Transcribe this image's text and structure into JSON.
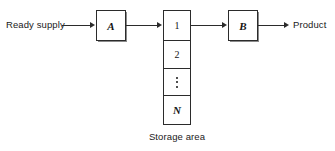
{
  "diagram": {
    "background_color": "#ffffff",
    "stroke_color": "#2b2b2b",
    "text_color": "#1a1a1a",
    "inputs": {
      "ready_supply_label": "Ready supply"
    },
    "outputs": {
      "product_label": "Product"
    },
    "process_boxes": [
      {
        "id": "A",
        "label": "A"
      },
      {
        "id": "B",
        "label": "B"
      }
    ],
    "storage": {
      "caption": "Storage area",
      "cells": [
        {
          "label": "1",
          "kind": "number"
        },
        {
          "label": "2",
          "kind": "number"
        },
        {
          "label": "⋮",
          "kind": "ellipsis"
        },
        {
          "label": "N",
          "kind": "variable"
        }
      ]
    },
    "connectors": [
      {
        "from": "ready-supply",
        "to": "box-a",
        "style": "arrow"
      },
      {
        "from": "box-a",
        "to": "storage-cell-1",
        "style": "arrow"
      },
      {
        "from": "storage-cell-1",
        "to": "box-b",
        "style": "arrow"
      },
      {
        "from": "box-b",
        "to": "product",
        "style": "arrow"
      }
    ]
  }
}
